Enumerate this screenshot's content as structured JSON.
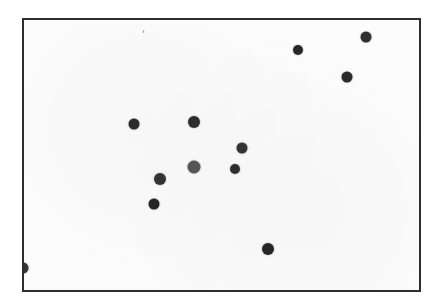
{
  "scene": {
    "description": "Framed white card with scattered dark dots",
    "background_color": "#ffffff",
    "frame": {
      "left": 22,
      "top": 18,
      "right": 421,
      "bottom": 292,
      "border_color": "#2e2e2e",
      "fill_color": "#fcfcfc"
    },
    "dots": [
      {
        "x": 366,
        "y": 37,
        "r": 5.5,
        "color": "#2f2f2f"
      },
      {
        "x": 298,
        "y": 50,
        "r": 5,
        "color": "#262626"
      },
      {
        "x": 347,
        "y": 77,
        "r": 5.5,
        "color": "#2a2a2a"
      },
      {
        "x": 134,
        "y": 124,
        "r": 5.5,
        "color": "#2b2b2b"
      },
      {
        "x": 194,
        "y": 122,
        "r": 6,
        "color": "#2c2c2c"
      },
      {
        "x": 242,
        "y": 148,
        "r": 5.5,
        "color": "#333333"
      },
      {
        "x": 194,
        "y": 167,
        "r": 6.5,
        "color": "#555555"
      },
      {
        "x": 235,
        "y": 169,
        "r": 5,
        "color": "#2d2d2d"
      },
      {
        "x": 160,
        "y": 179,
        "r": 6,
        "color": "#333333"
      },
      {
        "x": 154,
        "y": 204,
        "r": 5.5,
        "color": "#242424"
      },
      {
        "x": 268,
        "y": 249,
        "r": 6,
        "color": "#262626"
      },
      {
        "x": 23,
        "y": 268,
        "r": 5.5,
        "color": "#333333"
      }
    ],
    "specks": [
      {
        "x": 143,
        "y": 30
      }
    ]
  }
}
